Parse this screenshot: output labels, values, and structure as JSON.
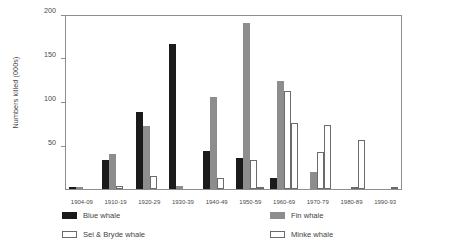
{
  "chart_data": {
    "type": "bar",
    "title": "",
    "xlabel": "",
    "ylabel": "Numbers killed (000s)",
    "ylim": [
      0,
      200
    ],
    "yticks": [
      0,
      50,
      100,
      150,
      200
    ],
    "ytick_labels": [
      "",
      "50",
      "100",
      "150",
      "200"
    ],
    "grid": false,
    "legend_position": "bottom",
    "categories": [
      "1904-09",
      "1910-19",
      "1920-29",
      "1930-39",
      "1940-49",
      "1950-59",
      "1960-69",
      "1970-79",
      "1980-89",
      "1990-93"
    ],
    "series": [
      {
        "name": "Blue whale",
        "color": "#1a1a1a",
        "values": [
          2,
          33,
          88,
          166,
          44,
          35,
          13,
          0,
          0,
          0
        ]
      },
      {
        "name": "Fin whale",
        "color": "#8d8d8d",
        "values": [
          2,
          40,
          72,
          3,
          105,
          190,
          124,
          20,
          0,
          0
        ]
      },
      {
        "name": "Sei & Bryde whale",
        "color": "#ffffff",
        "values": [
          0,
          4,
          15,
          0,
          13,
          33,
          112,
          42,
          1,
          0
        ]
      },
      {
        "name": "Minke whale",
        "color": "#ffffff",
        "values": [
          0,
          0,
          0,
          0,
          0,
          2,
          75,
          73,
          56,
          2
        ]
      }
    ]
  },
  "legend": {
    "items": [
      {
        "label": "Blue whale",
        "swatch": "blue-whale"
      },
      {
        "label": "Fin whale",
        "swatch": "fin-whale"
      },
      {
        "label": "Sei & Bryde whale",
        "swatch": "sei-whale"
      },
      {
        "label": "Minke whale",
        "swatch": "minke-whale"
      }
    ]
  },
  "axis": {
    "y_title": "Numbers killed (000s)"
  }
}
